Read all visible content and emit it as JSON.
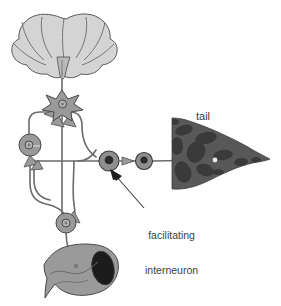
{
  "figure": {
    "kind": "neural-circuit-diagram",
    "background_color": "#ffffff"
  },
  "labels": {
    "tail": "tail",
    "facilitating_interneuron_line1": "facilitating",
    "facilitating_interneuron_line2": "interneuron"
  },
  "colors": {
    "outline": "#4a4a4a",
    "brain_fill": "#d4d4d4",
    "neuron_fill": "#9a9a9a",
    "neuron_nucleus_light": "#b5b5b5",
    "neuron_nucleus_dark": "#2b2b2b",
    "tail_fill": "#585858",
    "tail_blotch": "#3a3a3a",
    "muscle_fill": "#9a9a9a",
    "muscle_opening": "#1c1c1c",
    "axon_line": "#6b6b6b",
    "text": "#3d3d3d",
    "pointer_arrow": "#3d3d3d"
  },
  "parts": [
    {
      "name": "cerebral-ganglion",
      "role": "brain",
      "x": 62,
      "y": 45
    },
    {
      "name": "star-interneuron",
      "role": "interneuron",
      "x": 62,
      "y": 104
    },
    {
      "name": "left-motor-neuron",
      "role": "motor-neuron",
      "x": 30,
      "y": 145
    },
    {
      "name": "lower-motor-neuron",
      "role": "motor-neuron",
      "x": 67,
      "y": 224
    },
    {
      "name": "facilitating-interneuron",
      "role": "facilitating-interneuron",
      "x": 109,
      "y": 161
    },
    {
      "name": "sensory-neuron",
      "role": "sensory-neuron",
      "x": 144,
      "y": 161
    },
    {
      "name": "tail",
      "role": "target-organ",
      "x": 215,
      "y": 160
    },
    {
      "name": "muscle",
      "role": "effector-muscle",
      "x": 80,
      "y": 270
    }
  ]
}
